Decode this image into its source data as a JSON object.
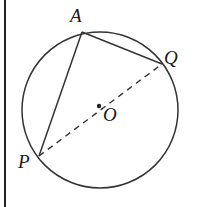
{
  "diagram": {
    "type": "circle-geometry",
    "circle": {
      "center": "O",
      "cx": 100,
      "cy": 110,
      "r": 78
    },
    "points": {
      "A": {
        "label": "A",
        "x": 82,
        "y": 32,
        "lx": 70,
        "ly": 22
      },
      "Q": {
        "label": "Q",
        "x": 162,
        "y": 64,
        "lx": 164,
        "ly": 64
      },
      "P": {
        "label": "P",
        "x": 39,
        "y": 156,
        "lx": 18,
        "ly": 168
      },
      "O": {
        "label": "O",
        "x": 99,
        "y": 106,
        "lx": 103,
        "ly": 120
      }
    },
    "segments": [
      {
        "from": "A",
        "to": "P",
        "style": "solid"
      },
      {
        "from": "A",
        "to": "Q",
        "style": "solid"
      },
      {
        "from": "P",
        "to": "Q",
        "style": "dashed",
        "through": "O"
      }
    ]
  }
}
